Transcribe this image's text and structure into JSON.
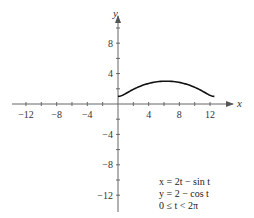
{
  "chart_data": {
    "type": "line",
    "title": "",
    "xlabel": "x",
    "ylabel": "y",
    "xlim": [
      -14,
      14
    ],
    "ylim": [
      -14,
      12
    ],
    "x_ticks": [
      -12,
      -8,
      -4,
      4,
      8,
      12
    ],
    "y_ticks": [
      8,
      4,
      -4,
      -8,
      -12
    ],
    "x_tick_labels": [
      "−12",
      "−8",
      "−4",
      "4",
      "8",
      "12"
    ],
    "y_tick_labels": [
      "8",
      "4",
      "−4",
      "−8",
      "−12"
    ],
    "grid": false,
    "series": [
      {
        "name": "x = 2t − sin t, y = 2 − cos t",
        "x": [
          0,
          0.79,
          2.33,
          4.51,
          6.28,
          8.05,
          10.22,
          11.78,
          12.57
        ],
        "y": [
          1,
          1.29,
          2.0,
          2.71,
          3.0,
          2.71,
          2.0,
          1.29,
          1.0
        ]
      }
    ],
    "annotations": [
      "x = 2t − sin t",
      "y = 2 − cos t",
      "0 ≤ t < 2π"
    ]
  },
  "labels": {
    "x_axis": "x",
    "y_axis": "y",
    "eq1": "x = 2t − sin t",
    "eq2": "y = 2 − cos t",
    "eq3": "0 ≤ t < 2π"
  }
}
